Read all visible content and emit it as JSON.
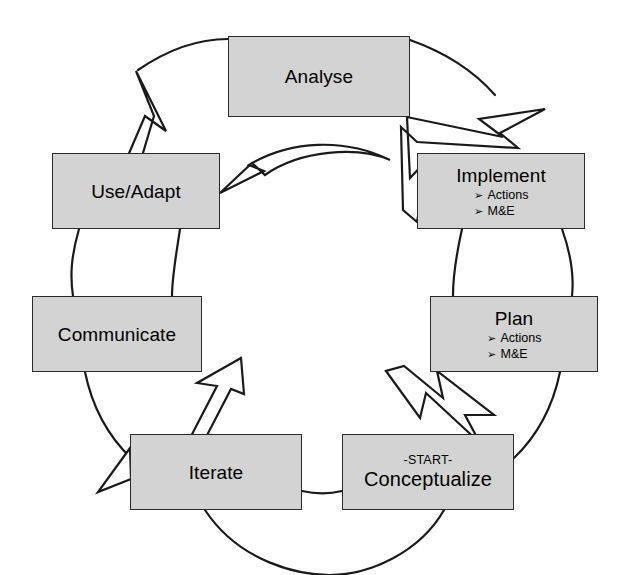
{
  "diagram": {
    "type": "cyclical-process-diagram",
    "title": "",
    "direction": "counter-clockwise",
    "colors": {
      "node_fill": "#d3d3d3",
      "node_border": "#2b2b2b",
      "connector": "#1a1a1a",
      "arrow_fill": "#ffffff",
      "background": "#ffffff",
      "text": "#000000"
    },
    "nodes": [
      {
        "id": "analyse",
        "label": "Analyse",
        "kicker": "",
        "bullets": [],
        "position": "top"
      },
      {
        "id": "implement",
        "label": "Implement",
        "kicker": "",
        "bullets": [
          "Actions",
          "M&E"
        ],
        "position": "upper-right"
      },
      {
        "id": "plan",
        "label": "Plan",
        "kicker": "",
        "bullets": [
          "Actions",
          "M&E"
        ],
        "position": "lower-right"
      },
      {
        "id": "conceptualize",
        "label": "Conceptualize",
        "kicker": "-START-",
        "bullets": [],
        "position": "bottom-right"
      },
      {
        "id": "iterate",
        "label": "Iterate",
        "kicker": "",
        "bullets": [],
        "position": "bottom-left"
      },
      {
        "id": "communicate",
        "label": "Communicate",
        "kicker": "",
        "bullets": [],
        "position": "lower-left"
      },
      {
        "id": "use-adapt",
        "label": "Use/Adapt",
        "kicker": "",
        "bullets": [],
        "position": "upper-left"
      }
    ],
    "bullet_glyph": "➢",
    "flow_arrows": [
      {
        "id": "arrow-to-use-adapt",
        "from": "analyse",
        "to": "use-adapt"
      },
      {
        "id": "arrow-to-implement",
        "from": "analyse",
        "to": "implement"
      },
      {
        "id": "arrow-to-communicate",
        "from": "iterate",
        "to": "communicate"
      },
      {
        "id": "arrow-to-conceptualize",
        "from": "plan",
        "to": "conceptualize"
      }
    ]
  }
}
